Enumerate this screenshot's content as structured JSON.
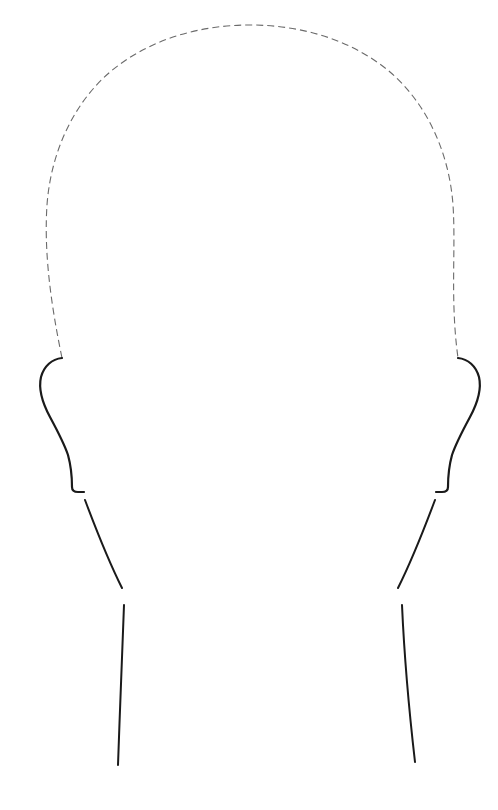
{
  "canvas": {
    "width": 498,
    "height": 810,
    "background_color": "#ffffff",
    "title": "Head Outline Template"
  },
  "style": {
    "dashed_stroke_color": "#6b6b6b",
    "dashed_stroke_width": 1.1,
    "dash_pattern": "7 4",
    "solid_stroke_color": "#1a1a1a",
    "solid_stroke_width": 2.0,
    "ear_stroke_width": 2.2,
    "neck_stroke_width": 2.0
  },
  "figure": {
    "name": "head-outline",
    "type": "line-drawing"
  },
  "paths": {
    "cranium": {
      "label": "cranium-dashed-arc",
      "stroke": "dashed",
      "d": "M 62 358 C 50 300 44 250 47 205 C 51 150 75 102 110 72 C 148 40 198 25 250 25 C 302 25 352 40 390 72 C 425 102 449 150 453 205 C 456 250 450 300 458 358"
    },
    "ear_left": {
      "label": "ear-left-outline",
      "stroke": "solid",
      "d": "M 62 358 C 52 359 44 366 41 377 C 38 390 43 404 50 417 C 57 430 64 443 68 455 C 71 466 72 478 72 487 C 72 490 74 492 78 492 L 84 492"
    },
    "ear_right": {
      "label": "ear-right-outline",
      "stroke": "solid",
      "d": "M 458 358 C 468 359 476 366 479 377 C 482 390 477 404 470 417 C 463 430 456 443 452 455 C 449 466 448 478 448 487 C 448 490 446 492 442 492 L 436 492"
    },
    "jaw_left": {
      "label": "jaw-left-line",
      "stroke": "solid",
      "d": "M 85 500 C 94 524 106 556 122 588"
    },
    "jaw_right": {
      "label": "jaw-right-line",
      "stroke": "solid",
      "d": "M 435 500 C 426 524 414 556 398 588"
    },
    "neck_left": {
      "label": "neck-left-line",
      "stroke": "solid",
      "d": "M 124 605 C 122 650 120 710 118 765"
    },
    "neck_right": {
      "label": "neck-right-line",
      "stroke": "solid",
      "d": "M 402 605 C 404 650 409 710 415 762"
    }
  }
}
